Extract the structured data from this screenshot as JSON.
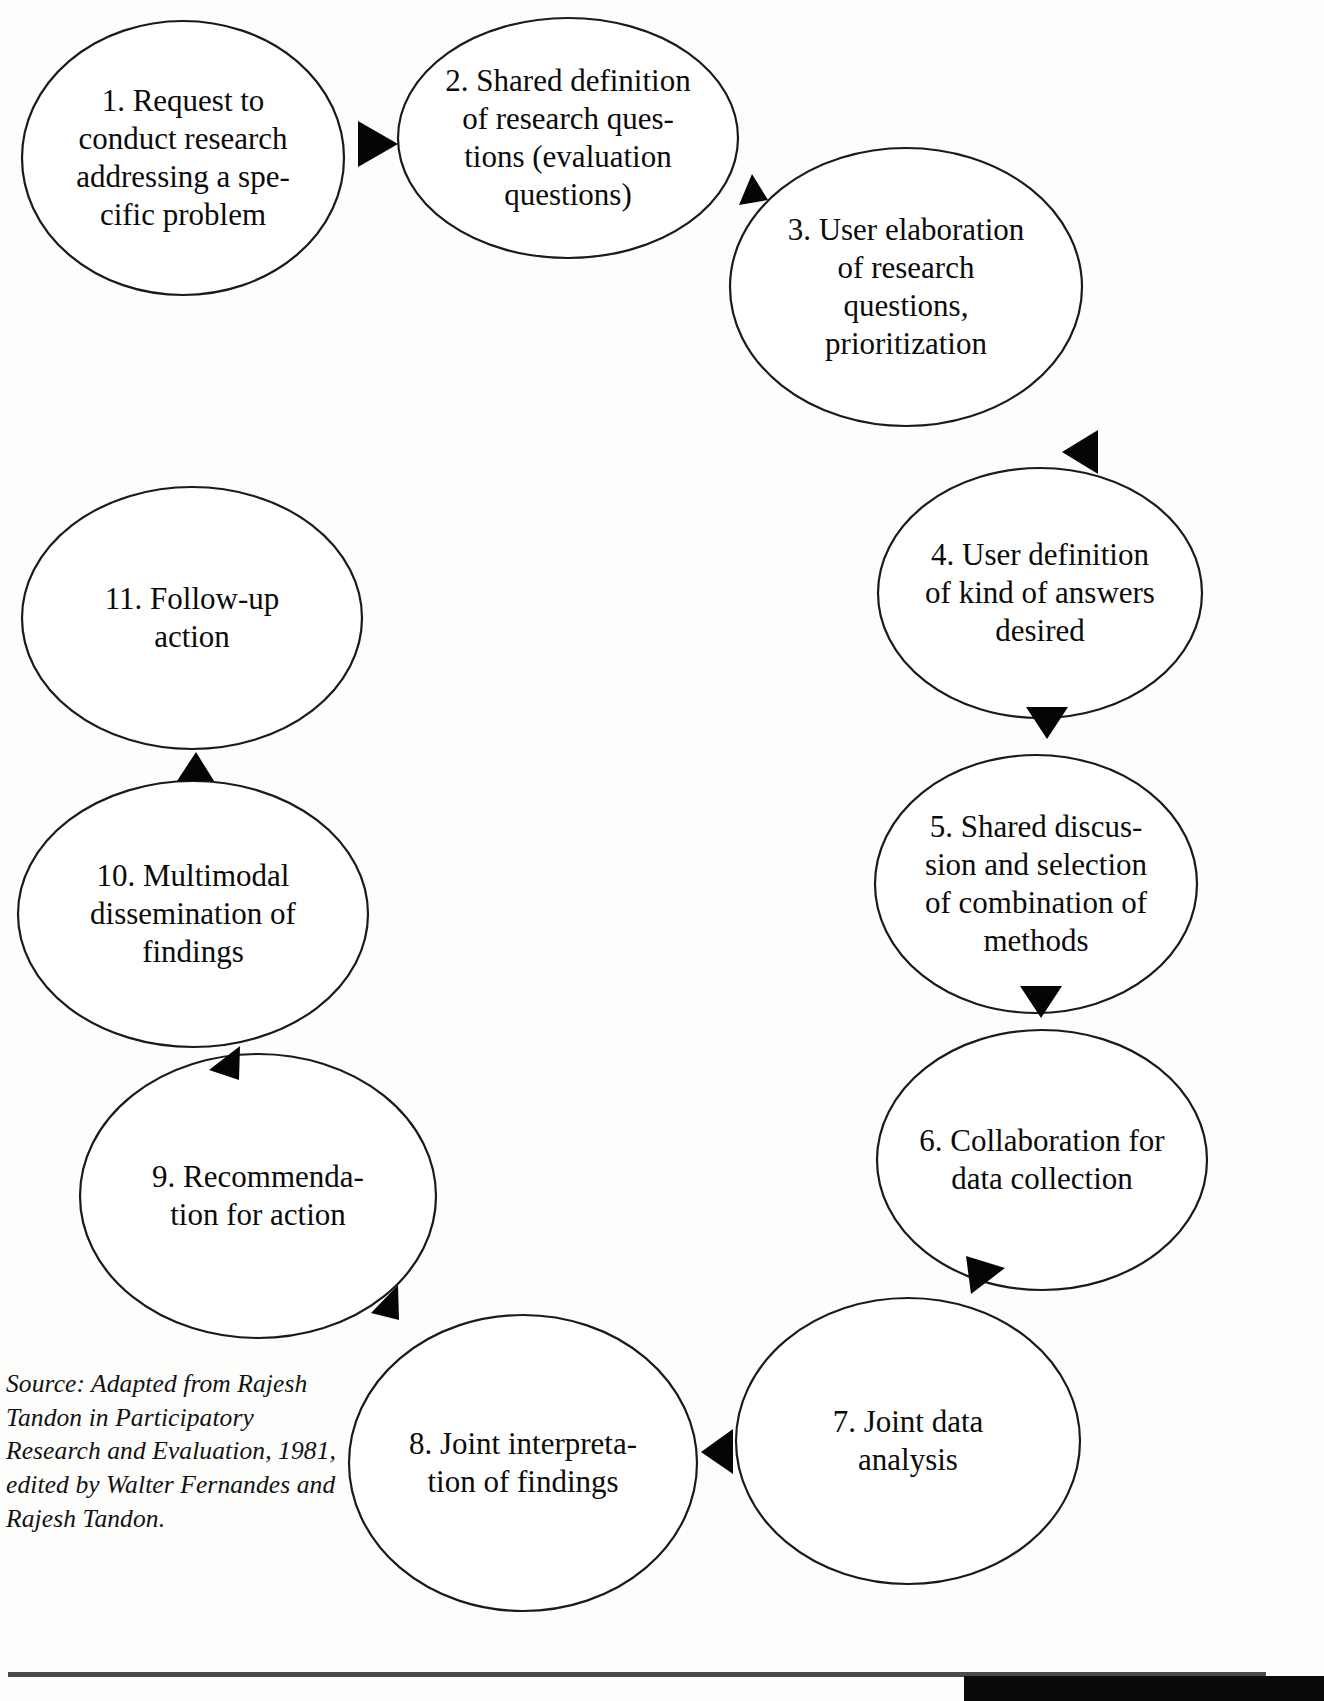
{
  "diagram": {
    "stroke_color": "#1a1a1a",
    "arrow_color": "#050505",
    "background_color": "#fdfdfc",
    "nodes": [
      {
        "id": "node-1",
        "number": "1.",
        "lines": [
          "1.  Request to",
          "conduct research",
          "addressing a spe-",
          "cific problem"
        ],
        "cx": 183,
        "cy": 158,
        "rx": 161,
        "ry": 137
      },
      {
        "id": "node-2",
        "number": "2.",
        "lines": [
          "2.  Shared definition",
          "of research ques-",
          "tions (evaluation",
          "questions)"
        ],
        "cx": 568,
        "cy": 138,
        "rx": 170,
        "ry": 120
      },
      {
        "id": "node-3",
        "number": "3.",
        "lines": [
          "3.  User elaboration",
          "of research",
          "questions,",
          "prioritization"
        ],
        "cx": 906,
        "cy": 287,
        "rx": 176,
        "ry": 139
      },
      {
        "id": "node-4",
        "number": "4.",
        "lines": [
          "4.  User definition",
          "of kind of answers",
          "desired"
        ],
        "cx": 1040,
        "cy": 593,
        "rx": 162,
        "ry": 125
      },
      {
        "id": "node-5",
        "number": "5.",
        "lines": [
          "5.  Shared discus-",
          "sion and selection",
          "of combination of",
          "methods"
        ],
        "cx": 1036,
        "cy": 884,
        "rx": 161,
        "ry": 129
      },
      {
        "id": "node-6",
        "number": "6.",
        "lines": [
          "6.  Collaboration for",
          "data collection"
        ],
        "cx": 1042,
        "cy": 1160,
        "rx": 165,
        "ry": 130
      },
      {
        "id": "node-7",
        "number": "7.",
        "lines": [
          "7.  Joint data",
          "analysis"
        ],
        "cx": 908,
        "cy": 1441,
        "rx": 172,
        "ry": 143
      },
      {
        "id": "node-8",
        "number": "8.",
        "lines": [
          "8.  Joint interpreta-",
          "tion of findings"
        ],
        "cx": 523,
        "cy": 1463,
        "rx": 174,
        "ry": 148
      },
      {
        "id": "node-9",
        "number": "9.",
        "lines": [
          "9.  Recommenda-",
          "tion for action"
        ],
        "cx": 258,
        "cy": 1196,
        "rx": 178,
        "ry": 142
      },
      {
        "id": "node-10",
        "number": "10.",
        "lines": [
          "10.  Multimodal",
          "dissemination of",
          "findings"
        ],
        "cx": 193,
        "cy": 914,
        "rx": 175,
        "ry": 133
      },
      {
        "id": "node-11",
        "number": "11.",
        "lines": [
          "11.  Follow-up",
          "action"
        ],
        "cx": 192,
        "cy": 618,
        "rx": 170,
        "ry": 131
      }
    ],
    "arrows": [
      {
        "id": "arrow-1-to-2",
        "from": "node-1",
        "to": "node-2",
        "points": "358,121 398,144 358,167",
        "label": "arrow-right"
      },
      {
        "id": "arrow-2-to-3",
        "from": "node-2",
        "to": "node-3",
        "points": "739,205 752,174 768,200",
        "label": "arrow-up-right"
      },
      {
        "id": "arrow-4-to-3",
        "from": "node-4",
        "to": "node-3",
        "points": "1062,452 1098,430 1098,474",
        "label": "arrow-left"
      },
      {
        "id": "arrow-4-to-5",
        "from": "node-4",
        "to": "node-5",
        "points": "1026,707 1068,707 1047,739",
        "label": "arrow-down"
      },
      {
        "id": "arrow-5-to-6",
        "from": "node-5",
        "to": "node-6",
        "points": "1020,986 1062,986 1041,1018",
        "label": "arrow-down"
      },
      {
        "id": "arrow-6-to-7",
        "from": "node-6",
        "to": "node-7",
        "points": "966,1256 1005,1268 971,1294",
        "label": "arrow-down-left"
      },
      {
        "id": "arrow-7-to-8",
        "from": "node-7",
        "to": "node-8",
        "points": "733,1429 701,1452 733,1474",
        "label": "arrow-left"
      },
      {
        "id": "arrow-8-to-9",
        "from": "node-8",
        "to": "node-9",
        "points": "371,1313 398,1285 399,1320",
        "label": "arrow-up-left"
      },
      {
        "id": "arrow-9-to-10",
        "from": "node-9",
        "to": "node-10",
        "points": "209,1070 240,1046 239,1080",
        "label": "arrow-up-left"
      },
      {
        "id": "arrow-10-to-11",
        "from": "node-10",
        "to": "node-11",
        "points": "177,781 196,752 214,781",
        "label": "arrow-up"
      }
    ]
  },
  "source_note": {
    "text": "Source: Adapted from Rajesh\nTandon in Participatory\nResearch and Evaluation, 1981,\nedited by Walter Fernandes and\nRajesh Tandon.",
    "x": 6,
    "y": 1367
  },
  "footer": {
    "page_number": "",
    "rule_color": "#4a4a4a",
    "block_color": "#0a0a0a"
  }
}
